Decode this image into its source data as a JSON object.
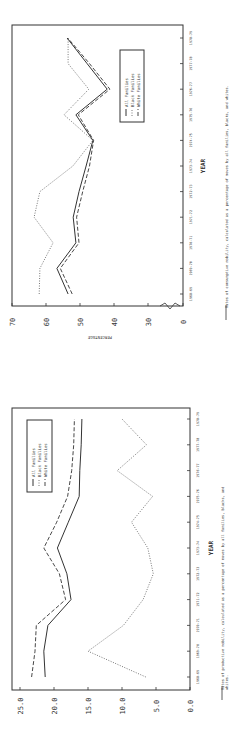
{
  "chart_data": [
    {
      "type": "line",
      "title": "Rates of consumptive mobility",
      "caption": "Rates of consumptive mobility, calculated as a percentage of moves by all families, blacks, and whites.",
      "xlabel": "YEAR",
      "ylabel": "PERCENTAGE",
      "y_ticks": [
        "0",
        "30",
        "40",
        "50",
        "60",
        "70"
      ],
      "ylim": [
        0,
        70
      ],
      "axis_break": "between 0 and 30",
      "grid": false,
      "legend_position": "upper right (in rotated frame)",
      "categories": [
        "1968-69",
        "1969-70",
        "1970-71",
        "1971-72",
        "1972-73",
        "1973-74",
        "1974-75",
        "1975-76",
        "1976-77",
        "1977-78",
        "1978-79"
      ],
      "series": [
        {
          "name": "All Families",
          "style": "solid",
          "values": [
            53.5,
            56.8,
            51.2,
            52.0,
            50.3,
            48.2,
            46.2,
            51.2,
            42.0,
            47.9,
            53.8
          ]
        },
        {
          "name": "Black Families",
          "style": "dotted",
          "values": [
            62.0,
            61.8,
            57.9,
            63.5,
            61.8,
            52.1,
            46.2,
            54.7,
            47.4,
            53.5,
            53.5
          ]
        },
        {
          "name": "White Families",
          "style": "dashed",
          "values": [
            52.3,
            55.8,
            50.3,
            51.0,
            49.2,
            47.2,
            46.0,
            50.5,
            41.2,
            47.2,
            53.6
          ]
        }
      ]
    },
    {
      "type": "line",
      "title": "Rates of productive mobility",
      "caption": "Rates of productive mobility, calculated as a percentage of moves by all families, blacks, and whites.",
      "xlabel": "YEAR",
      "ylabel": "",
      "y_ticks": [
        "0.0",
        "5.0",
        "10.0",
        "15.0",
        "20.0",
        "25.0"
      ],
      "ylim": [
        0,
        25
      ],
      "grid": false,
      "legend_position": "upper left (in rotated frame)",
      "categories": [
        "1968-69",
        "1969-70",
        "1970-71",
        "1971-72",
        "1972-73",
        "1973-74",
        "1974-75",
        "1975-76",
        "1976-77",
        "1977-78",
        "1978-79"
      ],
      "series": [
        {
          "name": "All Families",
          "style": "solid",
          "values": [
            21.3,
            21.5,
            20.9,
            17.5,
            18.1,
            19.5,
            17.9,
            16.3,
            16.2,
            16.0,
            15.9
          ]
        },
        {
          "name": "Black Families",
          "style": "dotted",
          "values": [
            6.5,
            15.0,
            9.8,
            6.9,
            5.4,
            6.2,
            8.6,
            5.5,
            10.7,
            6.4,
            10.0
          ]
        },
        {
          "name": "White Families",
          "style": "dashed",
          "values": [
            23.3,
            22.8,
            22.6,
            18.3,
            19.2,
            21.5,
            19.6,
            18.0,
            17.4,
            17.1,
            17.0
          ]
        }
      ]
    }
  ],
  "page": {
    "charts": [
      {
        "xlabel": "YEAR",
        "ylabel": "PERCENTAGE",
        "caption": "Rates of consumptive mobility, calculated as a percentage of moves by all families, blacks, and whites.",
        "legend": [
          "All Families",
          "Black Families",
          "White Families"
        ]
      },
      {
        "xlabel": "YEAR",
        "caption_line1": "Rates of productive mobility, calculated as a percentage of moves by all families, blacks, and",
        "caption_line2": "whites.",
        "legend": [
          "All Families",
          "Black Families",
          "White Families"
        ]
      }
    ]
  }
}
